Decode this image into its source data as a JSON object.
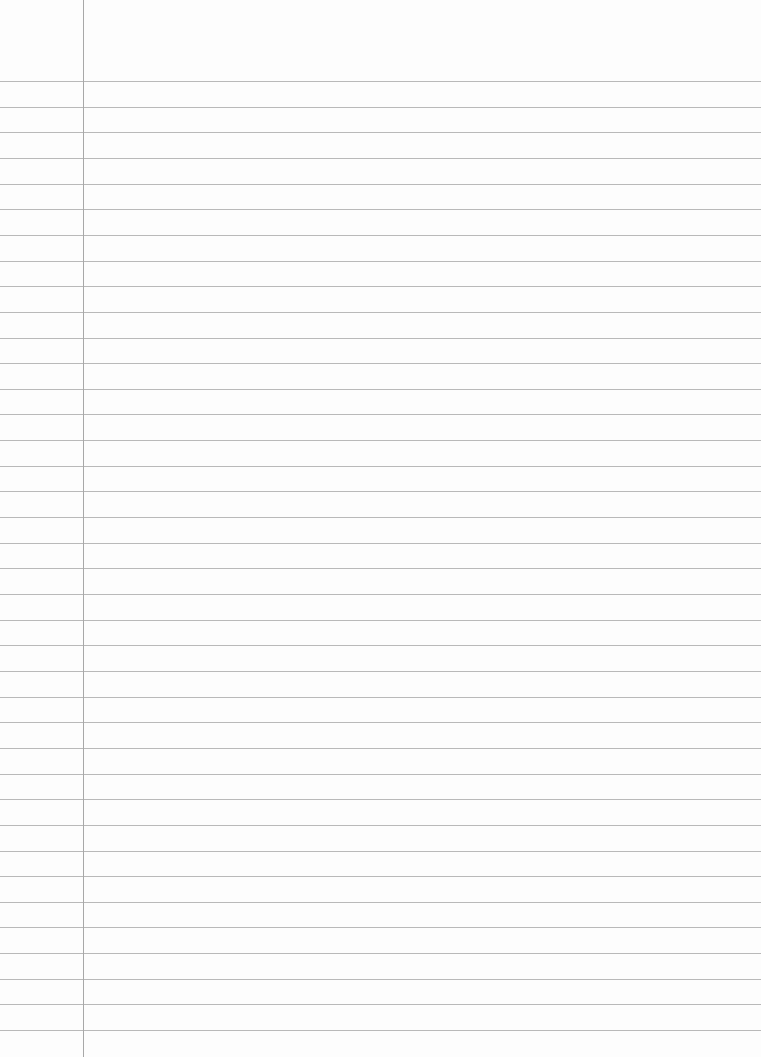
{
  "page": {
    "type": "ruled-notebook-paper",
    "background_color": "#fdfdfd",
    "rule_color": "#b9b9b9",
    "margin_line_color": "#a8a8a8",
    "margin_line_x": 83,
    "first_rule_y": 81,
    "rule_spacing": 25.65,
    "rule_count": 38,
    "text": ""
  }
}
